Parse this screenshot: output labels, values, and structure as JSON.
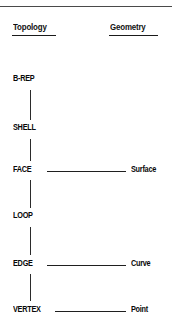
{
  "figure": {
    "type": "relationship-diagram",
    "columns": [
      {
        "id": "topology",
        "title": "Topology"
      },
      {
        "id": "geometry",
        "title": "Geometry"
      }
    ],
    "topology_nodes": [
      {
        "id": "brep",
        "label": "B-REP"
      },
      {
        "id": "shell",
        "label": "SHELL"
      },
      {
        "id": "face",
        "label": "FACE"
      },
      {
        "id": "loop",
        "label": "LOOP"
      },
      {
        "id": "edge",
        "label": "EDGE"
      },
      {
        "id": "vertex",
        "label": "VERTEX"
      }
    ],
    "geometry_nodes": [
      {
        "id": "surface",
        "label": "Surface"
      },
      {
        "id": "curve",
        "label": "Curve"
      },
      {
        "id": "point",
        "label": "Point"
      }
    ],
    "vertical_links": [
      {
        "from": "brep",
        "to": "shell"
      },
      {
        "from": "shell",
        "to": "face"
      },
      {
        "from": "face",
        "to": "loop"
      },
      {
        "from": "loop",
        "to": "edge"
      },
      {
        "from": "edge",
        "to": "vertex"
      }
    ],
    "horizontal_links": [
      {
        "from": "face",
        "to": "surface"
      },
      {
        "from": "edge",
        "to": "curve"
      },
      {
        "from": "vertex",
        "to": "point"
      }
    ],
    "colors": {
      "ink": "#0a0a0a",
      "rule": "#4a4a4a",
      "background": "#ffffff"
    }
  }
}
